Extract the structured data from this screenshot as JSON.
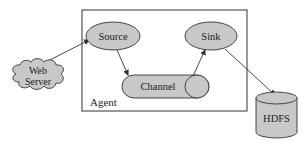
{
  "diagram": {
    "agent": {
      "label": "Agent"
    },
    "nodes": {
      "web_server": {
        "line1": "Web",
        "line2": "Server",
        "shape": "cloud"
      },
      "source": {
        "label": "Source",
        "shape": "ellipse"
      },
      "channel": {
        "label": "Channel",
        "shape": "horizontal-cylinder"
      },
      "sink": {
        "label": "Sink",
        "shape": "ellipse"
      },
      "hdfs": {
        "label": "HDFS",
        "shape": "cylinder"
      }
    },
    "edges": [
      {
        "from": "web_server",
        "to": "source"
      },
      {
        "from": "source",
        "to": "channel"
      },
      {
        "from": "channel",
        "to": "sink"
      },
      {
        "from": "sink",
        "to": "hdfs"
      }
    ],
    "colors": {
      "fill": "#c8c8c8",
      "stroke": "#333333",
      "background": "#ffffff"
    }
  }
}
